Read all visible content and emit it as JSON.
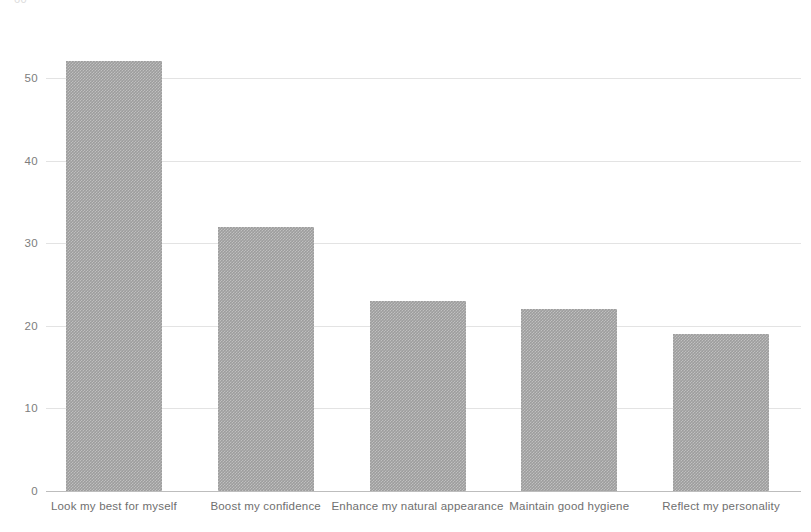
{
  "chart": {
    "clipped_top_label": "60",
    "y_axis": {
      "ticks": [
        "0",
        "10",
        "20",
        "30",
        "40",
        "50"
      ]
    },
    "x_axis": {
      "labels": [
        "Look my best for myself",
        "Boost my confidence",
        "Enhance my natural appearance",
        "Maintain good hygiene",
        "Reflect my personality"
      ]
    },
    "colors": {
      "bar_fill": "#9d9d9d",
      "gridline": "#e3e3e3",
      "baseline": "#bdbdbd",
      "tick_text": "#7d7d7d",
      "background": "#ffffff"
    }
  },
  "chart_data": {
    "type": "bar",
    "title": "",
    "subtitle": "",
    "xlabel": "",
    "ylabel": "",
    "categories": [
      "Look my best for myself",
      "Boost my confidence",
      "Enhance my natural appearance",
      "Maintain good hygiene",
      "Reflect my personality"
    ],
    "values": [
      52,
      32,
      23,
      22,
      19
    ],
    "ylim": [
      0,
      60
    ],
    "yticks": [
      0,
      10,
      20,
      30,
      40,
      50
    ],
    "grid": true,
    "legend": false,
    "orientation": "vertical",
    "bar_color": "#9d9d9d"
  }
}
